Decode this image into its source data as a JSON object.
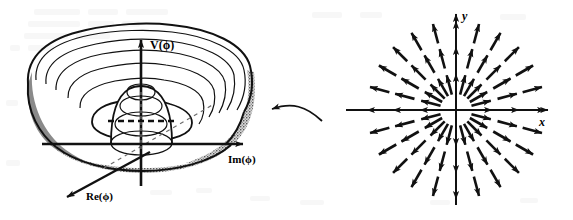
{
  "figure": {
    "name": "mexican-hat-potential-and-radial-vector-field",
    "background_color": "#ffffff",
    "ink_color": "#111111",
    "panels": [
      {
        "id": "left",
        "name": "mexican-hat-potential",
        "type": "3d-surface-sketch",
        "axes": [
          {
            "id": "v",
            "label": "V(ϕ)",
            "direction": "up",
            "style": "solid-arrow"
          },
          {
            "id": "im",
            "label": "Im(ϕ)",
            "direction": "right",
            "style": "solid-arrow"
          },
          {
            "id": "re",
            "label": "Re(ϕ)",
            "direction": "down-left",
            "style": "solid-arrow"
          }
        ],
        "features": {
          "contour_rings": 7,
          "central_bump_rings": 4,
          "dashed_midline": true,
          "shading_left": "#8f8f8f",
          "shading_right": "#b9b9b9",
          "rim_texture": "stipple"
        }
      },
      {
        "id": "right",
        "name": "radial-vector-field",
        "type": "vector-field",
        "axes": [
          {
            "id": "y",
            "label": "y",
            "direction": "up",
            "style": "solid-arrow"
          },
          {
            "id": "x",
            "label": "x",
            "direction": "right",
            "style": "solid-arrow"
          }
        ],
        "field": {
          "pattern": "radial-outward",
          "spokes": 24,
          "rings": 3,
          "ring_radii": [
            26,
            53,
            79
          ],
          "arrow_length": 20,
          "origin": {
            "x": 456,
            "y": 110
          }
        }
      }
    ],
    "connector": {
      "name": "curved-pointer-arrow",
      "from_panel": "right",
      "to_panel": "left",
      "direction": "left"
    },
    "artifacts": {
      "name": "scan-ghosting",
      "description": "faint illegible show-through text from reverse page",
      "color": "#f2f2f2"
    }
  }
}
